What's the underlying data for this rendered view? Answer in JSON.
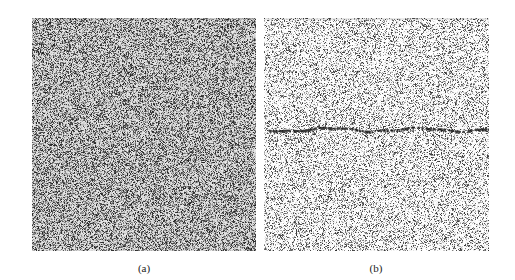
{
  "figure": {
    "panels": [
      {
        "id": "a",
        "label": "(a)",
        "box": {
          "x": 32,
          "y": 18,
          "w": 224,
          "h": 233
        },
        "texture": {
          "density": 0.58,
          "darkness": 0.85,
          "seed": 11,
          "base_gray": 205
        },
        "line": {
          "visible": true,
          "style": "faint",
          "y_frac": 0.47,
          "x_start_frac": 0.35,
          "x_end_frac": 1.0,
          "color": "#555555",
          "alpha": 0.35
        }
      },
      {
        "id": "b",
        "label": "(b)",
        "box": {
          "x": 264,
          "y": 18,
          "w": 225,
          "h": 233
        },
        "texture": {
          "density": 0.38,
          "darkness": 0.8,
          "seed": 29,
          "base_gray": 238
        },
        "line": {
          "visible": true,
          "style": "dashed",
          "y_frac": 0.475,
          "x_start_frac": 0.02,
          "x_end_frac": 1.0,
          "color": "#111111",
          "alpha": 0.95
        }
      }
    ],
    "captions": [
      {
        "text": "(a)",
        "x": 144,
        "y": 262
      },
      {
        "text": "(b)",
        "x": 376,
        "y": 262
      }
    ]
  }
}
